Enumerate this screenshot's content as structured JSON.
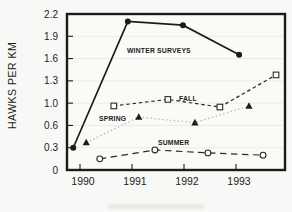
{
  "chart_data": {
    "type": "line",
    "title": "",
    "xlabel": "",
    "ylabel": "HAWKS PER KM",
    "x_ticks": [
      1990,
      1991,
      1992,
      1993
    ],
    "x_tick_labels": [
      "1990",
      "1991",
      "1992",
      "1993"
    ],
    "y_ticks": [
      0,
      0.3,
      0.6,
      1.0,
      1.3,
      1.6,
      1.9,
      2.2
    ],
    "y_tick_labels": [
      "0",
      "0.3",
      "0.6",
      "1.0",
      "1.3",
      "1.6",
      "1.9",
      "2.2"
    ],
    "ylim": [
      0,
      2.2
    ],
    "grid": "faint-horizontal-gridlines",
    "legend_position": "inline-labels",
    "ink_color": "#1c1c1c",
    "gridline_color": "#e0e0de",
    "series": [
      {
        "name": "WINTER SURVEYS",
        "line_style": "solid",
        "marker": "filled-circle",
        "color": "#1c1c1c",
        "marker_color": "#1c1c1c",
        "x": [
          1989.87,
          1990.92,
          1991.98,
          1993.06
        ],
        "values": [
          0.3,
          2.1,
          2.05,
          1.65
        ]
      },
      {
        "name": "SPRING",
        "line_style": "dotted",
        "marker": "filled-triangle",
        "color": "#b2b2ae",
        "marker_color": "#1c1c1c",
        "x": [
          1990.12,
          1991.13,
          1992.21,
          1993.25
        ],
        "values": [
          0.37,
          0.75,
          0.65,
          0.95
        ]
      },
      {
        "name": "SUMMER",
        "line_style": "long-dash",
        "marker": "open-circle",
        "color": "#2a2a2a",
        "marker_color": "#2a2a2a",
        "x": [
          1990.38,
          1991.44,
          1992.46,
          1993.52
        ],
        "values": [
          0.15,
          0.27,
          0.23,
          0.2
        ]
      },
      {
        "name": "FALL",
        "line_style": "short-dash",
        "marker": "open-square",
        "color": "#2a2a2a",
        "marker_color": "#2a2a2a",
        "x": [
          1990.65,
          1991.69,
          1992.69,
          1993.77
        ],
        "values": [
          0.95,
          1.05,
          0.93,
          1.38
        ]
      }
    ]
  }
}
